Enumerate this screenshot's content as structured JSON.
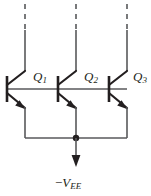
{
  "diagram": {
    "type": "circuit-schematic",
    "colors": {
      "line": "#58595b",
      "device": "#231f20",
      "text": "#231f20",
      "background": "#ffffff"
    },
    "transistors": [
      {
        "id": "Q1",
        "label_main": "Q",
        "label_sub": "1",
        "type": "npn",
        "base_x": 25,
        "label_x": 33,
        "label_y": 70
      },
      {
        "id": "Q2",
        "label_main": "Q",
        "label_sub": "2",
        "type": "npn",
        "base_x": 76,
        "label_x": 84,
        "label_y": 70
      },
      {
        "id": "Q3",
        "label_main": "Q",
        "label_sub": "3",
        "type": "npn",
        "base_x": 127,
        "label_x": 133,
        "label_y": 70
      }
    ],
    "supply": {
      "minus": "−",
      "symbol": "V",
      "subscript": "EE",
      "label_x": 55,
      "label_y": 176
    },
    "nets": {
      "base_rail_label": "common-base-rail",
      "emitter_rail_label": "common-emitter-rail",
      "collector_label": "collector-open-terminals"
    }
  }
}
